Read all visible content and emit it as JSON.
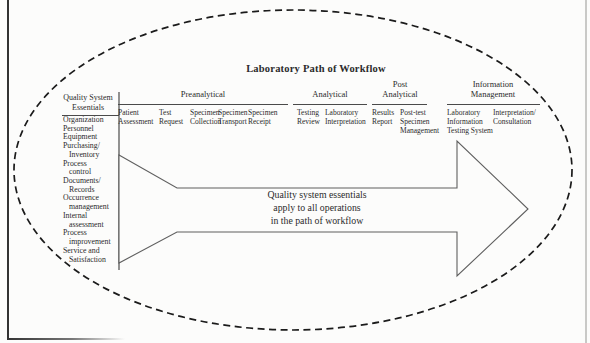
{
  "figure": {
    "title": "Laboratory Path of Workflow"
  },
  "qse": {
    "header": [
      "Quality System",
      "Essentials"
    ],
    "items": [
      [
        "Organization"
      ],
      [
        "Personnel"
      ],
      [
        "Equipment"
      ],
      [
        "Purchasing/",
        "Inventory"
      ],
      [
        "Process",
        "control"
      ],
      [
        "Documents/",
        "Records"
      ],
      [
        "Occurrence",
        "management"
      ],
      [
        "Internal",
        "assessment"
      ],
      [
        "Process",
        "improvement"
      ],
      [
        "Service and",
        "Satisfaction"
      ]
    ]
  },
  "stages": [
    {
      "label": [
        "Preanalytical"
      ],
      "steps": [
        [
          "Patient",
          "Assessment"
        ],
        [
          "Test",
          "Request"
        ],
        [
          "Specimen",
          "Collection"
        ],
        [
          "Specimen",
          "Transport"
        ],
        [
          "Specimen",
          "Receipt"
        ]
      ]
    },
    {
      "label": [
        "Analytical"
      ],
      "steps": [
        [
          "Testing",
          "Review"
        ],
        [
          "Laboratory",
          "Interpretation"
        ]
      ]
    },
    {
      "label": [
        "Post",
        "Analytical"
      ],
      "steps": [
        [
          "Results",
          "Report"
        ],
        [
          "Post-test",
          "Specimen",
          "Management"
        ]
      ]
    },
    {
      "label": [
        "Information",
        "Management"
      ],
      "steps": [
        [
          "Laboratory",
          "Information",
          "Testing System"
        ],
        [
          "Interpretation/",
          "Consultation"
        ]
      ]
    }
  ],
  "arrow_caption": [
    "Quality system essentials",
    "apply to all operations",
    "in the path of workflow"
  ],
  "colors": {
    "paper": "#fcfcfb",
    "ink": "#2b2b2b",
    "line": "#4a4a4a",
    "arrow_outline": "#5f5f5f",
    "ellipse_dash": "#1b1b1b",
    "left_border": "#333333",
    "right_border": "#c9c9c7"
  }
}
